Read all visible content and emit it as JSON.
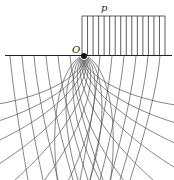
{
  "diagram": {
    "type": "half-plane stress trajectory / slip-line field under strip load",
    "labels": {
      "load": "p",
      "origin": "O"
    },
    "colors": {
      "line": "#333333",
      "grid": "#555555",
      "background": "#ffffff"
    },
    "load_block": {
      "x1": 82,
      "x2": 165,
      "y_top": 16,
      "y_bottom": 55,
      "hatch_count": 15
    },
    "surface": {
      "y": 55,
      "x1": 5,
      "x2": 172
    },
    "origin_point": {
      "x": 84,
      "y": 56
    }
  }
}
